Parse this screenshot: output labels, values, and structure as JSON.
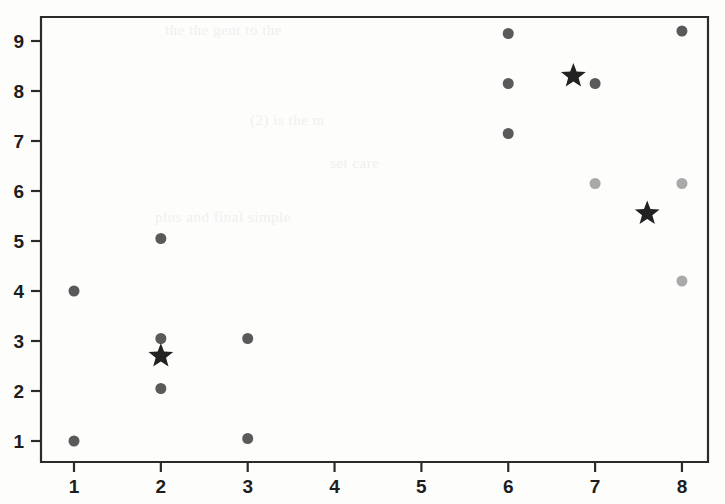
{
  "figure": {
    "background_color": "#fdfdfc",
    "axis_color": "#2b2b2b",
    "point_color": "#5a5a5a",
    "point_color_light": "#a9a9a9",
    "centroid_color": "#222222"
  },
  "axes": {
    "x_tick_labels": [
      "1",
      "2",
      "3",
      "4",
      "5",
      "6",
      "7",
      "8"
    ],
    "y_tick_labels": [
      "1",
      "2",
      "3",
      "4",
      "5",
      "6",
      "7",
      "8",
      "9"
    ]
  },
  "chart_data": {
    "type": "scatter",
    "title": "",
    "xlabel": "",
    "ylabel": "",
    "xlim": [
      0.62,
      8.3
    ],
    "ylim": [
      0.58,
      9.48
    ],
    "xticks": [
      1,
      2,
      3,
      4,
      5,
      6,
      7,
      8
    ],
    "yticks": [
      1,
      2,
      3,
      4,
      5,
      6,
      7,
      8,
      9
    ],
    "grid": false,
    "legend": false,
    "series": [
      {
        "name": "data-points-dark",
        "marker": "circle",
        "color": "#5a5a5a",
        "size": 11,
        "points": [
          {
            "x": 1.0,
            "y": 4.0
          },
          {
            "x": 1.0,
            "y": 1.0
          },
          {
            "x": 2.0,
            "y": 5.05
          },
          {
            "x": 2.0,
            "y": 3.05
          },
          {
            "x": 2.0,
            "y": 2.05
          },
          {
            "x": 3.0,
            "y": 3.05
          },
          {
            "x": 3.0,
            "y": 1.05
          },
          {
            "x": 6.0,
            "y": 9.15
          },
          {
            "x": 6.0,
            "y": 8.15
          },
          {
            "x": 6.0,
            "y": 7.15
          },
          {
            "x": 7.0,
            "y": 8.15
          },
          {
            "x": 8.0,
            "y": 9.2
          }
        ]
      },
      {
        "name": "data-points-light",
        "marker": "circle",
        "color": "#a9a9a9",
        "size": 11,
        "points": [
          {
            "x": 7.0,
            "y": 6.15
          },
          {
            "x": 8.0,
            "y": 6.15
          },
          {
            "x": 8.0,
            "y": 4.2
          }
        ]
      },
      {
        "name": "centroids",
        "marker": "star",
        "color": "#222222",
        "size": 26,
        "points": [
          {
            "x": 2.0,
            "y": 2.7
          },
          {
            "x": 6.75,
            "y": 8.3
          },
          {
            "x": 7.6,
            "y": 5.55
          }
        ]
      }
    ]
  }
}
